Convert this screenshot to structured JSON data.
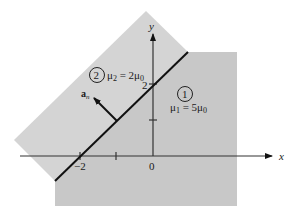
{
  "diagram": {
    "type": "magnetostatic boundary between two media",
    "boundary_line": "y = x + 2",
    "colors": {
      "background": "#ffffff",
      "region_2_fill": "#d2d2d2",
      "region_1_fill": "#c6c6c6",
      "line": "#111111",
      "axis": "#333333"
    },
    "axes": {
      "x_label": "x",
      "y_label": "y",
      "origin_label": "0",
      "x_tick_label": "−2",
      "y_tick_label": "2"
    },
    "region_1": {
      "number": "1",
      "permeability_label": "μ",
      "permeability_sub": "1",
      "permeability_eq": " = 5μ",
      "permeability_eq_sub": "0"
    },
    "region_2": {
      "number": "2",
      "permeability_label": "μ",
      "permeability_sub": "2",
      "permeability_eq": " = 2μ",
      "permeability_eq_sub": "0"
    },
    "normal_vector": {
      "label": "a",
      "label_sub": "n"
    }
  }
}
